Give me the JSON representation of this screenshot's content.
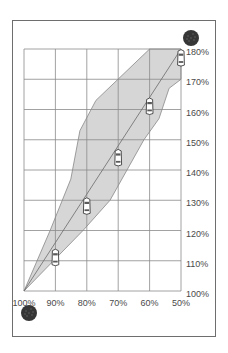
{
  "chart_data": {
    "type": "line",
    "title": "",
    "xlabel": "",
    "ylabel": "",
    "x_tick_labels": [
      "100%",
      "90%",
      "80%",
      "70%",
      "60%",
      "50%"
    ],
    "x_values": [
      100,
      90,
      80,
      70,
      60,
      50
    ],
    "y_tick_labels": [
      "100%",
      "110%",
      "120%",
      "130%",
      "140%",
      "150%",
      "160%",
      "170%",
      "180%"
    ],
    "y_values": [
      100,
      110,
      120,
      130,
      140,
      150,
      160,
      170,
      180
    ],
    "xlim": [
      100,
      50
    ],
    "ylim": [
      100,
      180
    ],
    "grid": true,
    "legend": null,
    "series": [
      {
        "name": "center-line",
        "points": [
          [
            100,
            100
          ],
          [
            90,
            116
          ],
          [
            80,
            132
          ],
          [
            70,
            148
          ],
          [
            60,
            164
          ],
          [
            50,
            180
          ]
        ]
      },
      {
        "name": "band-upper-edge",
        "points": [
          [
            100,
            100
          ],
          [
            91.7,
            120
          ],
          [
            85.1,
            137
          ],
          [
            82.2,
            153
          ],
          [
            77.1,
            163
          ],
          [
            60,
            180
          ]
        ]
      },
      {
        "name": "band-lower-edge",
        "points": [
          [
            100,
            100
          ],
          [
            81.2,
            120
          ],
          [
            72.6,
            130
          ],
          [
            67.2,
            140
          ],
          [
            61.8,
            150
          ],
          [
            57,
            157
          ],
          [
            53.8,
            167
          ],
          [
            50,
            170
          ]
        ]
      }
    ],
    "markers": [
      {
        "name": "car",
        "x": 90,
        "y": 111
      },
      {
        "name": "car",
        "x": 80,
        "y": 128
      },
      {
        "name": "car",
        "x": 70,
        "y": 144
      },
      {
        "name": "car",
        "x": 60,
        "y": 161
      },
      {
        "name": "car",
        "x": 50,
        "y": 177
      }
    ],
    "annotations": [
      {
        "name": "dark-dial-top-right",
        "near": "180%"
      },
      {
        "name": "dark-dial-bottom-left",
        "near": "100%"
      }
    ]
  },
  "layout": {
    "frame": {
      "x": 12.5,
      "y": 20.5,
      "w": 203,
      "h": 316
    },
    "plot": {
      "x0": 24,
      "x1": 181,
      "y0": 291,
      "y1": 49
    },
    "dials": [
      {
        "cx": 191,
        "cy": 38,
        "r": 8
      },
      {
        "cx": 29,
        "cy": 313,
        "r": 8
      }
    ]
  },
  "colors": {
    "band_fill": "#d6d6d6",
    "grid": "#8a8a8a",
    "text": "#4a4a4a",
    "dial": "#363636"
  }
}
